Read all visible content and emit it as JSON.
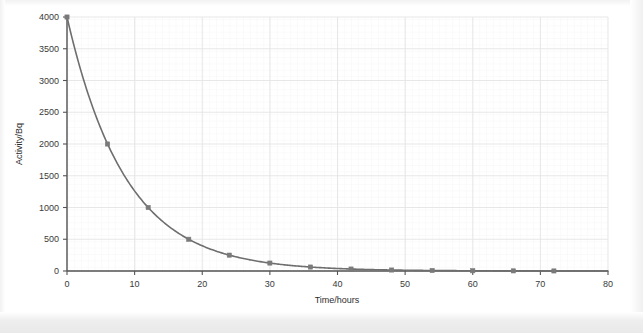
{
  "chart_data": {
    "type": "line",
    "title": "",
    "subtitle": "",
    "xlabel": "Time/hours",
    "ylabel": "Activity/Bq",
    "xlim": [
      0,
      80
    ],
    "ylim": [
      0,
      4000
    ],
    "xticks": [
      0,
      10,
      20,
      30,
      40,
      50,
      60,
      70,
      80
    ],
    "yticks": [
      0,
      500,
      1000,
      1500,
      2000,
      2500,
      3000,
      3500,
      4000
    ],
    "xtick_labels": [
      "0",
      "10",
      "20",
      "30",
      "40",
      "50",
      "60",
      "70",
      "80"
    ],
    "ytick_labels": [
      "0",
      "500",
      "1000",
      "1500",
      "2000",
      "2500",
      "3000",
      "3500",
      "4000"
    ],
    "grid": true,
    "grid_major_step_x": 10,
    "grid_major_step_y": 500,
    "grid_minor_step_x": 2,
    "grid_minor_step_y": 100,
    "legend": false,
    "legend_position": "none",
    "annotations": [],
    "series": [
      {
        "name": "Activity",
        "marker": "square",
        "color": "#7a7a7a",
        "line_color": "#6e6e6e",
        "x": [
          0,
          6,
          12,
          18,
          24,
          30,
          36,
          42,
          48,
          54,
          60,
          66,
          72
        ],
        "values": [
          4000,
          2000,
          1000,
          500,
          250,
          125,
          62.5,
          31.25,
          15.6,
          7.8,
          3.9,
          2,
          1
        ]
      }
    ],
    "model": {
      "description": "exponential decay",
      "initial_activity": 4000,
      "half_life_hours": 6
    }
  },
  "colors": {
    "curve": "#6e6e6e",
    "marker": "#7a7a7a",
    "axis": "#555555",
    "grid_major": "#e4e4e4",
    "grid_minor": "#f1f1f1",
    "text": "#333333",
    "background": "#ffffff"
  }
}
